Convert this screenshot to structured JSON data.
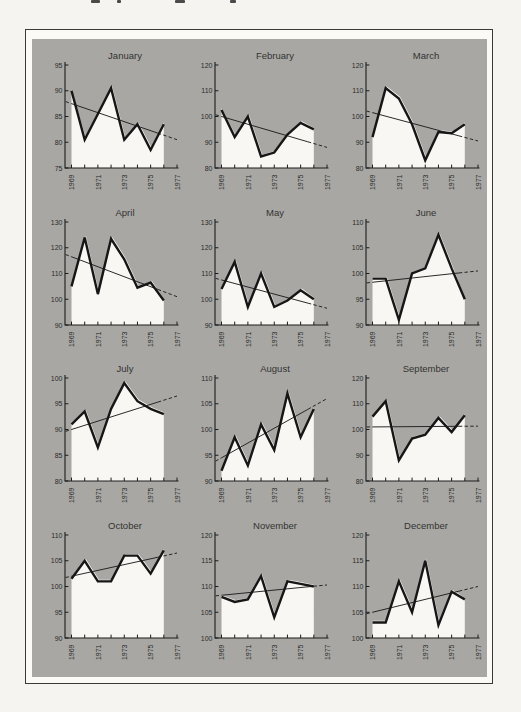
{
  "page": {
    "background": "#f5f4f1",
    "frame_border_color": "#3a3a3a",
    "frame_margin_color": "#fbfaf7",
    "panel_color": "#a8a7a4",
    "area_fill_color": "#f8f7f3",
    "data_line_color": "#161616",
    "trend_line_color": "#1f1f1f",
    "cropped_text_fragments": [
      {
        "x": 91,
        "w": 9
      },
      {
        "x": 117,
        "w": 4
      },
      {
        "x": 175,
        "w": 10
      },
      {
        "x": 230,
        "w": 6
      }
    ]
  },
  "chart_data": {
    "type": "line",
    "layout": {
      "rows": 4,
      "cols": 3,
      "grid": false,
      "legend": "none"
    },
    "x_years": [
      1969,
      1970,
      1971,
      1972,
      1973,
      1974,
      1975,
      1976
    ],
    "xticks": [
      1969,
      1970,
      1971,
      1972,
      1973,
      1974,
      1975,
      1976,
      1977
    ],
    "xtick_labels": [
      "1969",
      "1971",
      "1973",
      "1975",
      "1977"
    ],
    "charts": [
      {
        "title": "January",
        "ylim": [
          75,
          95
        ],
        "yticks": [
          75,
          80,
          85,
          90,
          95
        ],
        "values": [
          90,
          80.5,
          85.5,
          90.5,
          80.5,
          83.5,
          78.5,
          83.5
        ],
        "trend": {
          "y1969": 87.5,
          "y1977": 80.5
        }
      },
      {
        "title": "February",
        "ylim": [
          80,
          120
        ],
        "yticks": [
          80,
          90,
          100,
          110,
          120
        ],
        "values": [
          102.5,
          92,
          100,
          84.5,
          86,
          93,
          97.5,
          95
        ],
        "trend": {
          "y1969": 100,
          "y1977": 88
        }
      },
      {
        "title": "March",
        "ylim": [
          80,
          120
        ],
        "yticks": [
          80,
          90,
          100,
          110,
          120
        ],
        "values": [
          92,
          111,
          107,
          97,
          83,
          94,
          93.5,
          97
        ],
        "trend": {
          "y1969": 101.5,
          "y1977": 90.5
        }
      },
      {
        "title": "April",
        "ylim": [
          90,
          130
        ],
        "yticks": [
          90,
          100,
          110,
          120,
          130
        ],
        "values": [
          105,
          124,
          102,
          123.5,
          115.5,
          104.5,
          106.5,
          99.5
        ],
        "trend": {
          "y1969": 116.5,
          "y1977": 101
        }
      },
      {
        "title": "May",
        "ylim": [
          90,
          130
        ],
        "yticks": [
          90,
          100,
          110,
          120,
          130
        ],
        "values": [
          104,
          114.5,
          97,
          110,
          97,
          99.5,
          103.5,
          100
        ],
        "trend": {
          "y1969": 107.5,
          "y1977": 96.5
        }
      },
      {
        "title": "June",
        "ylim": [
          90,
          110
        ],
        "yticks": [
          90,
          95,
          100,
          105,
          110
        ],
        "values": [
          99,
          99,
          91,
          100,
          101,
          107.5,
          101,
          95
        ],
        "trend": {
          "y1969": 98.3,
          "y1977": 100.5
        }
      },
      {
        "title": "July",
        "ylim": [
          80,
          100
        ],
        "yticks": [
          80,
          85,
          90,
          95,
          100
        ],
        "values": [
          91,
          93.5,
          86.5,
          94,
          99,
          95.5,
          94,
          93
        ],
        "trend": {
          "y1969": 90,
          "y1977": 96.5
        }
      },
      {
        "title": "August",
        "ylim": [
          90,
          110
        ],
        "yticks": [
          90,
          95,
          100,
          105,
          110
        ],
        "values": [
          92,
          98.5,
          93,
          101,
          96,
          107,
          98.5,
          104
        ],
        "trend": {
          "y1969": 94.5,
          "y1977": 106
        }
      },
      {
        "title": "September",
        "ylim": [
          80,
          120
        ],
        "yticks": [
          80,
          90,
          100,
          110,
          120
        ],
        "values": [
          105,
          111,
          88,
          96.5,
          98,
          104.5,
          99,
          105.5
        ],
        "trend": {
          "y1969": 101,
          "y1977": 101.3
        }
      },
      {
        "title": "October",
        "ylim": [
          90,
          110
        ],
        "yticks": [
          90,
          95,
          100,
          105,
          110
        ],
        "values": [
          101.5,
          105,
          101,
          101,
          106,
          106,
          102.5,
          107
        ],
        "trend": {
          "y1969": 102,
          "y1977": 106.5
        }
      },
      {
        "title": "November",
        "ylim": [
          100,
          120
        ],
        "yticks": [
          100,
          105,
          110,
          115,
          120
        ],
        "values": [
          108,
          107,
          107.5,
          112,
          104,
          111,
          110.5,
          110
        ],
        "trend": {
          "y1969": 108.3,
          "y1977": 110.3
        }
      },
      {
        "title": "December",
        "ylim": [
          100,
          120
        ],
        "yticks": [
          100,
          105,
          110,
          115,
          120
        ],
        "values": [
          103,
          103,
          111,
          105,
          115,
          102.5,
          109,
          107.5
        ],
        "trend": {
          "y1969": 105,
          "y1977": 110
        }
      }
    ]
  }
}
